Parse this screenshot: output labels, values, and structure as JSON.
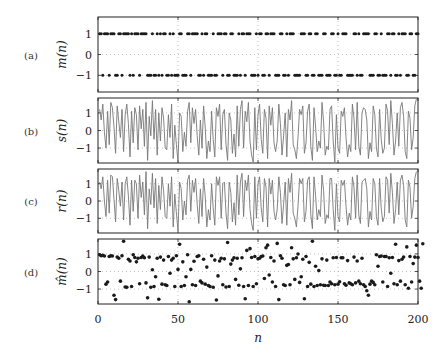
{
  "figure": {
    "xlabel": "n",
    "xticks": [
      0,
      50,
      100,
      150,
      200
    ],
    "xlim": [
      0,
      200
    ]
  },
  "chart_data": [
    {
      "type": "scatter",
      "panel": "(a)",
      "ylabel": "m(n)",
      "yticks": [
        -1,
        0,
        1
      ],
      "ylim": [
        -1.8,
        1.8
      ],
      "grid": true,
      "x_range": [
        1,
        200
      ],
      "values": [
        1,
        1,
        -1,
        1,
        1,
        1,
        -1,
        1,
        1,
        1,
        -1,
        -1,
        1,
        1,
        -1,
        1,
        1,
        1,
        1,
        -1,
        1,
        -1,
        1,
        1,
        1,
        -1,
        1,
        1,
        1,
        1,
        -1,
        -1,
        -1,
        1,
        -1,
        -1,
        1,
        -1,
        1,
        -1,
        1,
        1,
        -1,
        -1,
        1,
        -1,
        1,
        -1,
        -1,
        -1,
        1,
        1,
        -1,
        -1,
        -1,
        1,
        1,
        -1,
        1,
        1,
        1,
        1,
        -1,
        -1,
        1,
        -1,
        1,
        1,
        -1,
        -1,
        -1,
        1,
        -1,
        -1,
        1,
        1,
        1,
        -1,
        1,
        1,
        -1,
        -1,
        1,
        1,
        -1,
        -1,
        -1,
        1,
        -1,
        1,
        1,
        -1,
        1,
        1,
        1,
        -1,
        -1,
        -1,
        1,
        -1,
        1,
        1,
        -1,
        -1,
        1,
        1,
        -1,
        1,
        1,
        1,
        -1,
        -1,
        -1,
        1,
        1,
        -1,
        -1,
        1,
        -1,
        1,
        1,
        1,
        -1,
        -1,
        -1,
        -1,
        1,
        1,
        1,
        -1,
        -1,
        1,
        1,
        -1,
        -1,
        1,
        1,
        -1,
        -1,
        -1,
        1,
        1,
        -1,
        -1,
        -1,
        1,
        1,
        -1,
        -1,
        1,
        -1,
        -1,
        1,
        1,
        1,
        -1,
        -1,
        -1,
        -1,
        1,
        1,
        -1,
        1,
        -1,
        -1,
        1,
        1,
        1,
        1,
        -1,
        -1,
        -1,
        1,
        1,
        -1,
        -1,
        1,
        -1,
        -1,
        -1,
        1,
        1,
        -1,
        1,
        1,
        -1,
        -1,
        1,
        -1,
        1,
        1,
        1,
        -1,
        -1,
        1,
        1,
        -1,
        -1,
        1,
        1
      ]
    },
    {
      "type": "line",
      "panel": "(b)",
      "ylabel": "s(n)",
      "yticks": [
        -1,
        0,
        1
      ],
      "ylim": [
        -1.85,
        1.85
      ],
      "grid": true,
      "x_range": [
        1,
        200
      ],
      "values": [
        1.2,
        0.6,
        1.5,
        -0.1,
        -1.0,
        1.1,
        -0.8,
        1.6,
        1.3,
        0.2,
        -1.3,
        1.4,
        0.5,
        -0.4,
        1.2,
        -1.2,
        0.9,
        1.5,
        0.4,
        -1.5,
        1.1,
        -0.7,
        1.3,
        0.9,
        -1.1,
        1.4,
        0.1,
        1.2,
        -0.9,
        1.6,
        -1.7,
        0.8,
        -0.3,
        1.7,
        -0.5,
        1.2,
        -1.4,
        1.0,
        -0.6,
        1.3,
        0.7,
        -1.0,
        -1.1,
        0.9,
        -0.4,
        1.5,
        -1.6,
        0.3,
        -0.8,
        -1.8,
        1.0,
        0.8,
        -1.2,
        -0.1,
        -0.9,
        1.1,
        1.6,
        -0.7,
        1.3,
        0.4,
        1.2,
        -0.3,
        -1.4,
        0.6,
        -1.0,
        1.4,
        0.2,
        -1.6,
        -0.6,
        -1.2,
        1.1,
        -0.5,
        -1.5,
        1.3,
        0.8,
        1.5,
        -1.1,
        0.9,
        1.2,
        -0.8,
        -1.7,
        1.0,
        0.6,
        -1.3,
        -0.2,
        -1.5,
        1.4,
        -0.9,
        1.2,
        1.7,
        -1.0,
        1.1,
        0.5,
        1.6,
        -0.6,
        -1.4,
        -1.8,
        1.3,
        -1.1,
        0.9,
        1.5,
        -0.5,
        -1.3,
        1.2,
        0.7,
        -1.6,
        1.4,
        0.3,
        1.3,
        -0.7,
        -1.2,
        -0.6,
        1.5,
        0.4,
        -1.4,
        -0.3,
        1.0,
        -1.5,
        1.2,
        0.6,
        1.7,
        -0.8,
        -1.1,
        -1.6,
        -0.4,
        1.2,
        0.9,
        1.4,
        -1.3,
        -0.7,
        1.1,
        1.5,
        -0.9,
        -1.7,
        1.3,
        0.2,
        -1.2,
        -0.6,
        -1.0,
        1.6,
        0.5,
        -1.4,
        -0.9,
        -1.1,
        1.2,
        1.4,
        -0.6,
        -1.8,
        0.9,
        -1.0,
        -1.3,
        1.1,
        0.8,
        1.3,
        -0.4,
        -1.5,
        -0.8,
        -1.2,
        1.5,
        0.7,
        -1.1,
        1.6,
        -0.9,
        -1.4,
        1.0,
        1.3,
        1.2,
        0.6,
        -1.6,
        -0.7,
        -1.2,
        1.4,
        0.9,
        -1.0,
        -1.5,
        1.2,
        -0.5,
        -1.3,
        -1.0,
        1.5,
        1.1,
        -0.8,
        1.7,
        0.4,
        -1.4,
        -0.6,
        1.0,
        -0.9,
        1.3,
        1.6,
        0.8,
        -1.2,
        -1.6,
        1.1,
        0.7,
        -1.1,
        -0.4,
        1.4,
        1.8
      ]
    },
    {
      "type": "line",
      "panel": "(c)",
      "ylabel": "r(n)",
      "yticks": [
        -1,
        0,
        1
      ],
      "ylim": [
        -1.85,
        1.85
      ],
      "grid": true,
      "x_range": [
        1,
        200
      ],
      "values": [
        1.1,
        0.7,
        1.4,
        0.0,
        -0.9,
        1.2,
        -0.7,
        1.5,
        1.4,
        0.1,
        -1.2,
        1.3,
        0.6,
        -0.3,
        1.1,
        -1.1,
        1.0,
        1.4,
        0.3,
        -1.4,
        1.2,
        -0.6,
        1.2,
        1.0,
        -1.0,
        1.5,
        0.2,
        1.1,
        -0.8,
        1.7,
        -1.6,
        0.7,
        -0.2,
        1.6,
        -0.4,
        1.3,
        -1.3,
        0.9,
        -0.5,
        1.4,
        0.6,
        -0.9,
        -1.0,
        1.0,
        -0.3,
        1.4,
        -1.5,
        0.4,
        -0.7,
        -1.7,
        1.1,
        0.7,
        -1.1,
        0.0,
        -0.8,
        1.2,
        1.5,
        -0.6,
        1.2,
        0.5,
        1.3,
        -0.2,
        -1.3,
        0.7,
        -0.9,
        1.3,
        0.3,
        -1.5,
        -0.5,
        -1.1,
        1.0,
        -0.4,
        -1.4,
        1.4,
        0.9,
        1.4,
        -1.0,
        1.0,
        1.1,
        -0.7,
        -1.6,
        1.1,
        0.5,
        -1.2,
        -0.1,
        -1.4,
        1.5,
        -0.8,
        1.1,
        1.6,
        -0.9,
        1.2,
        0.6,
        1.5,
        -0.5,
        -1.3,
        -1.7,
        1.4,
        -1.0,
        1.0,
        1.4,
        -0.4,
        -1.2,
        1.3,
        0.8,
        -1.5,
        1.3,
        0.4,
        1.2,
        -0.6,
        -1.1,
        -0.5,
        1.4,
        0.5,
        -1.3,
        -0.2,
        1.1,
        -1.4,
        1.3,
        0.5,
        1.6,
        -0.7,
        -1.0,
        -1.5,
        -0.3,
        1.3,
        1.0,
        1.3,
        -1.2,
        -0.6,
        1.2,
        1.4,
        -0.8,
        -1.6,
        1.4,
        0.3,
        -1.1,
        -0.5,
        -0.9,
        1.5,
        0.6,
        -1.3,
        -0.8,
        -1.0,
        1.3,
        1.3,
        -0.5,
        -1.7,
        1.0,
        -0.9,
        -1.2,
        1.2,
        0.9,
        1.2,
        -0.3,
        -1.4,
        -0.7,
        -1.1,
        1.4,
        0.8,
        -1.0,
        1.5,
        -0.8,
        -1.3,
        1.1,
        1.2,
        1.3,
        0.7,
        -1.5,
        -0.6,
        -1.1,
        1.3,
        1.0,
        -0.9,
        -1.4,
        1.3,
        -0.4,
        -1.2,
        -0.9,
        1.4,
        1.2,
        -0.7,
        1.6,
        0.5,
        -1.3,
        -0.5,
        1.1,
        -0.8,
        1.2,
        1.5,
        0.9,
        -1.1,
        -1.5,
        1.2,
        0.8,
        -1.0,
        -0.3,
        1.3,
        1.7
      ]
    },
    {
      "type": "scatter",
      "panel": "(d)",
      "ylabel": "m̂(n)",
      "yticks": [
        -1,
        0,
        1
      ],
      "ylim": [
        -1.85,
        1.85
      ],
      "grid": true,
      "x_range": [
        1,
        200
      ],
      "values": [
        0.95,
        0.9,
        0.92,
        0.88,
        -0.72,
        -0.6,
        0.85,
        0.9,
        0.88,
        -1.35,
        -1.6,
        0.82,
        0.75,
        -0.55,
        0.9,
        1.72,
        -0.88,
        -0.9,
        0.7,
        0.6,
        -0.85,
        0.95,
        0.8,
        0.55,
        0.75,
        -0.7,
        0.8,
        0.88,
        0.78,
        -0.65,
        -1.5,
        0.82,
        -0.9,
        0.1,
        -0.85,
        -0.3,
        0.75,
        -1.58,
        0.82,
        -0.72,
        0.65,
        -0.75,
        -0.8,
        0.85,
        -0.1,
        0.65,
        0.75,
        -0.85,
        0.9,
        0.12,
        1.55,
        -0.85,
        0.55,
        -0.8,
        -0.3,
        0.95,
        -1.72,
        0.12,
        -0.75,
        0.58,
        -0.8,
        0.85,
        0.9,
        -0.55,
        -0.65,
        0.7,
        -0.72,
        0.25,
        -0.8,
        -0.85,
        0.9,
        -0.9,
        0.65,
        -1.62,
        -0.25,
        0.6,
        0.75,
        -0.75,
        0.72,
        -0.88,
        1.65,
        -0.85,
        0.42,
        0.65,
        0.78,
        -0.45,
        0.75,
        -0.78,
        0.15,
        0.78,
        -0.85,
        -1.55,
        1.2,
        -0.8,
        1.3,
        0.8,
        -0.85,
        0.85,
        -0.7,
        0.72,
        0.75,
        0.85,
        0.88,
        -0.4,
        1.35,
        1.5,
        -0.2,
        0.8,
        -0.6,
        0.6,
        -0.85,
        1.6,
        -1.6,
        0.9,
        0.75,
        -0.75,
        -0.8,
        0.35,
        0.4,
        -0.75,
        1.35,
        0.72,
        -0.45,
        0.78,
        1.0,
        -0.62,
        -0.3,
        0.7,
        -1.55,
        0.85,
        -0.85,
        0.52,
        -0.72,
        1.72,
        -0.85,
        0.3,
        -0.8,
        0.05,
        -0.75,
        0.72,
        -0.78,
        -0.8,
        0.65,
        -0.8,
        -0.6,
        -0.7,
        0.78,
        -0.75,
        0.8,
        -0.72,
        -0.58,
        0.78,
        0.78,
        -0.7,
        -0.78,
        0.62,
        -0.65,
        -0.7,
        -0.75,
        0.82,
        -0.65,
        0.6,
        -0.55,
        -0.7,
        0.75,
        -0.75,
        -0.85,
        -1.1,
        -1.35,
        -0.72,
        -0.55,
        -0.62,
        -0.75,
        0.95,
        0.3,
        0.85,
        0.88,
        -0.6,
        0.85,
        0.85,
        -0.85,
        0.78,
        -0.1,
        0.8,
        -0.7,
        1.55,
        -0.75,
        0.62,
        -0.55,
        0.7,
        0.82,
        -0.75,
        1.4,
        -0.95,
        0.85,
        -0.6,
        0.45,
        0.82,
        1.5,
        0.8,
        -0.55,
        -0.95,
        1.58
      ]
    }
  ]
}
